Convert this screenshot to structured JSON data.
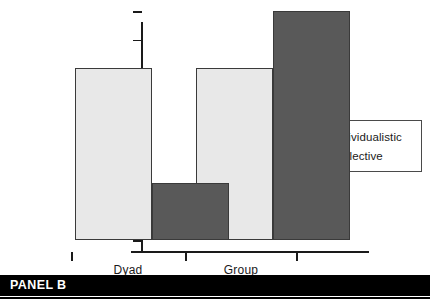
{
  "chart_data": {
    "type": "bar",
    "title": "",
    "xlabel": "",
    "ylabel": "Impasse Rates (%)",
    "ylim": [
      0,
      40
    ],
    "yticks": [
      0,
      5,
      10,
      15,
      20,
      25,
      30,
      35,
      40
    ],
    "ytick_labels": [
      "0",
      "5",
      "10",
      "15",
      "20",
      "25",
      "30",
      "35",
      "40"
    ],
    "categories": [
      "Dyad",
      "Group"
    ],
    "grid": false,
    "legend_position": "right",
    "series": [
      {
        "name": "Individualistic",
        "color": "#e8e8e8",
        "values": [
          30,
          30
        ]
      },
      {
        "name": "Collective",
        "color": "#595959",
        "values": [
          10,
          40
        ]
      }
    ]
  },
  "panel": {
    "label": "PANEL B"
  },
  "colors": {
    "individualistic": "#e8e8e8",
    "collective": "#595959",
    "axis": "#1a1a1a",
    "bar_edge": "#3a3a3a",
    "panel_background": "#000000",
    "panel_text": "#ffffff"
  }
}
